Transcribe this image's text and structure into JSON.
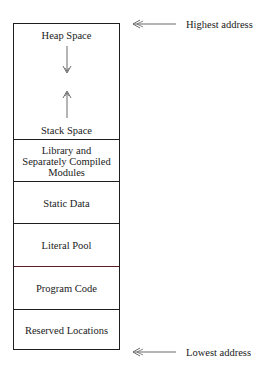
{
  "diagram": {
    "regions": [
      {
        "id": "heap-stack",
        "heap_label": "Heap Space",
        "stack_label": "Stack Space",
        "heap_arrow": "down",
        "stack_arrow": "up"
      },
      {
        "id": "library",
        "label": "Library and Separately Compiled Modules",
        "lines": [
          "Library and",
          "Separately Compiled",
          "Modules"
        ]
      },
      {
        "id": "static-data",
        "label": "Static Data"
      },
      {
        "id": "literal-pool",
        "label": "Literal Pool"
      },
      {
        "id": "program-code",
        "label": "Program Code"
      },
      {
        "id": "reserved",
        "label": "Reserved Locations"
      }
    ],
    "markers": {
      "top": {
        "label": "Highest address",
        "arrow": "left"
      },
      "bottom": {
        "label": "Lowest address",
        "arrow": "left"
      }
    },
    "colors": {
      "line": "#1e1e1e",
      "accent_divider": "#5a1e24",
      "arrow": "#6a6a6a",
      "text": "#1a1a1a"
    }
  }
}
